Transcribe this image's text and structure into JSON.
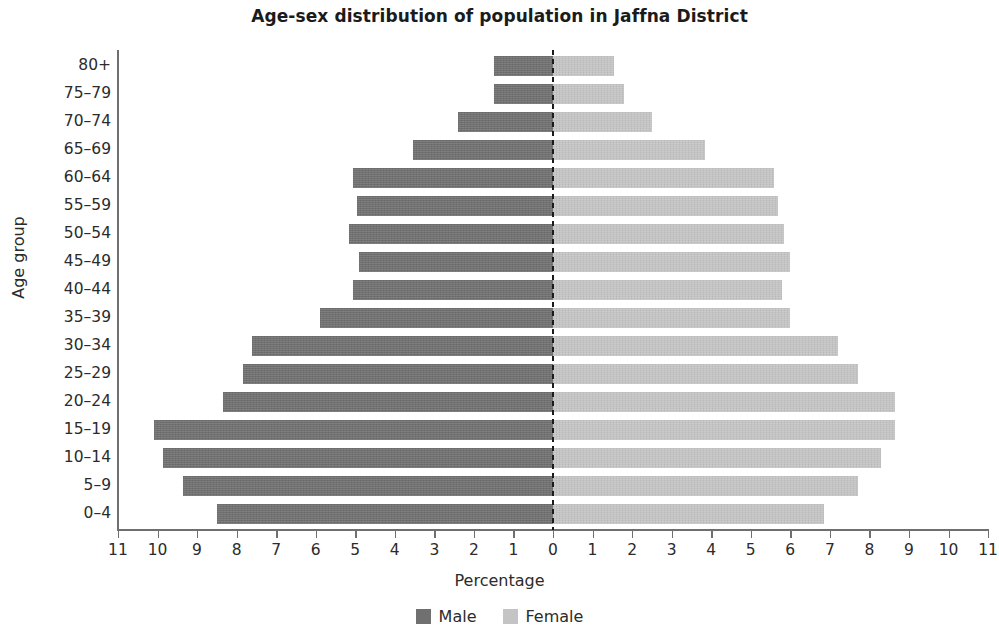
{
  "chart_data": {
    "type": "bar",
    "subtype": "population-pyramid",
    "title": "Age-sex distribution of population in Jaffna District",
    "xlabel": "Percentage",
    "ylabel": "Age group",
    "grid": false,
    "legend_position": "bottom",
    "xlim": [
      -11,
      11
    ],
    "xticks": [
      -11,
      -10,
      -9,
      -8,
      -7,
      -6,
      -5,
      -4,
      -3,
      -2,
      -1,
      0,
      1,
      2,
      3,
      4,
      5,
      6,
      7,
      8,
      9,
      10,
      11
    ],
    "xticklabels": [
      "11",
      "10",
      "9",
      "8",
      "7",
      "6",
      "5",
      "4",
      "3",
      "2",
      "1",
      "0",
      "1",
      "2",
      "3",
      "4",
      "5",
      "6",
      "7",
      "8",
      "9",
      "10",
      "11"
    ],
    "categories": [
      "80+",
      "75-79",
      "70-74",
      "65-69",
      "60-64",
      "55-59",
      "50-54",
      "45-49",
      "40-44",
      "35-39",
      "30-34",
      "25-29",
      "20-24",
      "15-19",
      "10-14",
      "5-9",
      "0-4"
    ],
    "series": [
      {
        "name": "Male",
        "color": "#707070",
        "side": "left",
        "values": [
          1.5,
          1.5,
          2.4,
          3.55,
          5.05,
          4.95,
          5.15,
          4.9,
          5.05,
          5.9,
          7.6,
          7.85,
          8.35,
          10.1,
          9.85,
          9.35,
          8.5
        ]
      },
      {
        "name": "Female",
        "color": "#c4c4c4",
        "side": "right",
        "values": [
          1.55,
          1.8,
          2.5,
          3.85,
          5.6,
          5.7,
          5.85,
          6.0,
          5.8,
          6.0,
          7.2,
          7.7,
          8.65,
          8.65,
          8.3,
          7.7,
          6.85
        ]
      }
    ]
  },
  "legend": {
    "items": [
      {
        "label": "Male",
        "color": "#707070"
      },
      {
        "label": "Female",
        "color": "#c4c4c4"
      }
    ]
  }
}
